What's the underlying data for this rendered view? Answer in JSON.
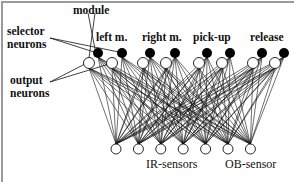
{
  "diagram": {
    "labels": {
      "module": "module",
      "selector_neurons_line1": "selector",
      "selector_neurons_line2": "neurons",
      "output_neurons_line1": "output",
      "output_neurons_line2": "neurons",
      "ir_sensors": "IR-sensors",
      "ob_sensor": "OB-sensor"
    },
    "modules": [
      {
        "name": "left m."
      },
      {
        "name": "right m."
      },
      {
        "name": "pick-up"
      },
      {
        "name": "release"
      }
    ],
    "selector_neurons": {
      "count": 8,
      "color": "#000000",
      "fill": "filled"
    },
    "output_neurons": {
      "count": 8,
      "fill": "hollow"
    },
    "sensor_neurons": {
      "count": 7,
      "ir_count": 6,
      "ob_count": 1,
      "fill": "hollow"
    },
    "connections": "fully connected: every sensor neuron to every selector and output neuron"
  }
}
